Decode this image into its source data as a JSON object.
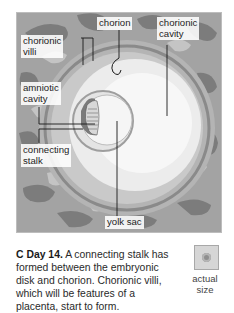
{
  "figure": {
    "labels": {
      "chorionic_villi": "chorionic\nvilli",
      "chorion": "chorion",
      "chorionic_cavity": "chorionic\ncavity",
      "amniotic_cavity": "amniotic\ncavity",
      "connecting_stalk": "connecting\nstalk",
      "yolk_sac": "yolk sac"
    },
    "colors": {
      "outer_tissue": "#9a9a9a",
      "tissue_dark": "#7a7a7a",
      "tissue_light": "#c6c6c6",
      "chorionic_cavity": "#f2f2f2",
      "leader_line": "#1a1a1a"
    }
  },
  "caption": {
    "letter": "C",
    "day": "Day 14.",
    "text": " A connecting stalk has formed between the embryonic disk and chorion. Chorionic villi, which will be features of a placenta, start to form."
  },
  "actual_size": {
    "label": "actual\nsize"
  }
}
